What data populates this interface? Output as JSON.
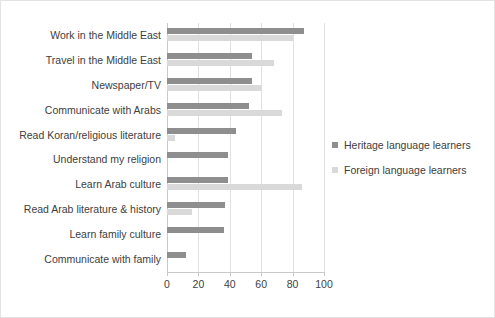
{
  "chart_data": {
    "type": "bar",
    "orientation": "horizontal",
    "title": "",
    "subtitle": "",
    "xlabel": "",
    "ylabel": "",
    "xlim": [
      0,
      100
    ],
    "xticks": [
      0,
      20,
      40,
      60,
      80,
      100
    ],
    "xtick_labels": [
      "0",
      "20",
      "40",
      "60",
      "80",
      "100"
    ],
    "grid": true,
    "grid_axis": "x",
    "legend_position": "right",
    "categories": [
      "Work in the Middle East",
      "Travel in the Middle East",
      "Newspaper/TV",
      "Communicate with Arabs",
      "Read Koran/religious literature",
      "Understand my religion",
      "Learn Arab culture",
      "Read Arab literature & history",
      "Learn family culture",
      "Communicate with family"
    ],
    "series": [
      {
        "name": "Heritage language learners",
        "color": "#8e8e8e",
        "values": [
          87,
          54,
          54,
          52,
          44,
          39,
          39,
          37,
          36,
          12
        ]
      },
      {
        "name": "Foreign language learners",
        "color": "#d9d9d9",
        "values": [
          80,
          68,
          60,
          73,
          5,
          0,
          86,
          16,
          0,
          0
        ]
      }
    ]
  },
  "legend": {
    "entries": [
      {
        "label": "Heritage language learners",
        "color": "#8e8e8e"
      },
      {
        "label": "Foreign language learners",
        "color": "#d9d9d9"
      }
    ]
  },
  "colors": {
    "heritage": "#8e8e8e",
    "foreign": "#d9d9d9",
    "grid": "#e0e0e0",
    "axis": "#c9c9c9",
    "text": "#404040",
    "frame": "#e3e3e3",
    "background": "#ffffff"
  }
}
